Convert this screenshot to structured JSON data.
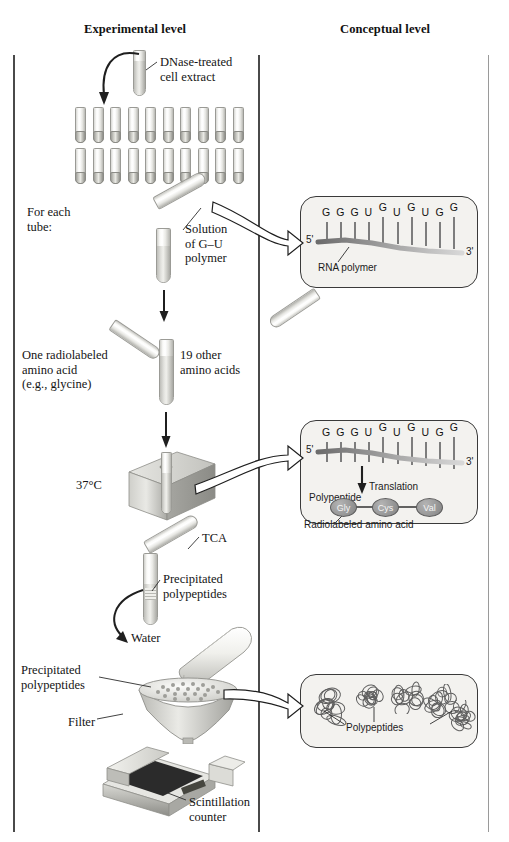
{
  "figure": {
    "columns": {
      "experimental": "Experimental level",
      "conceptual": "Conceptual level"
    }
  },
  "experimental": {
    "steps": [
      {
        "id": "cell-extract",
        "label": "DNase-treated\ncell extract"
      },
      {
        "id": "for-each-tube",
        "label": "For each\ntube:"
      },
      {
        "id": "gu-polymer",
        "label": "Solution\nof G–U\npolymer"
      },
      {
        "id": "radiolabeled-aa",
        "label": "One radiolabeled\namino acid\n(e.g., glycine)"
      },
      {
        "id": "other-aa",
        "label": "19 other\namino acids"
      },
      {
        "id": "incubation-temp",
        "label": "37°C"
      },
      {
        "id": "tca",
        "label": "TCA"
      },
      {
        "id": "precipitated-1",
        "label": "Precipitated\npolypeptides"
      },
      {
        "id": "water",
        "label": "Water"
      },
      {
        "id": "precipitated-2",
        "label": "Precipitated\npolypeptides"
      },
      {
        "id": "filter",
        "label": "Filter"
      },
      {
        "id": "scintillation",
        "label": "Scintillation\ncounter"
      }
    ],
    "tube_rack": {
      "rows": 2,
      "columns": 10,
      "total": 20
    }
  },
  "conceptual": {
    "panel_rna": {
      "five_prime": "5'",
      "three_prime": "3'",
      "sequence": [
        "G",
        "G",
        "G",
        "U",
        "G",
        "U",
        "G",
        "U",
        "G",
        "G"
      ],
      "caption": "RNA polymer"
    },
    "panel_translation": {
      "five_prime": "5'",
      "three_prime": "3'",
      "sequence": [
        "G",
        "G",
        "G",
        "U",
        "G",
        "U",
        "G",
        "U",
        "G",
        "G"
      ],
      "arrow_label": "Translation",
      "polypeptide_label": "Polypeptide",
      "residues": [
        "Gly",
        "Cys",
        "Val"
      ],
      "caption": "Radiolabeled amino acid"
    },
    "panel_polypeptides": {
      "caption": "Polypeptides",
      "blob_count": 5
    }
  },
  "colors": {
    "rule": "#4a4a4a",
    "panel_fill": "#f3f2ef",
    "panel_stroke": "#3a3a3a",
    "glass_light": "#ffffff",
    "glass_mid": "#d7d7d3",
    "glass_dark": "#9a9a95",
    "ink": "#1a1a1a",
    "residue_fill": "#8f8f8f"
  }
}
